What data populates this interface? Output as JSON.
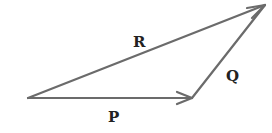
{
  "diagram": {
    "type": "vector-triangle",
    "stroke_color": "#6b6b6b",
    "label_color": "#222222",
    "vectors": [
      {
        "name": "P",
        "from": [
          28,
          98
        ],
        "to": [
          192,
          98
        ]
      },
      {
        "name": "Q",
        "from": [
          192,
          98
        ],
        "to": [
          265,
          5
        ]
      },
      {
        "name": "R",
        "from": [
          28,
          98
        ],
        "to": [
          265,
          5
        ]
      }
    ],
    "labels": {
      "P": "P",
      "Q": "Q",
      "R": "R"
    }
  }
}
